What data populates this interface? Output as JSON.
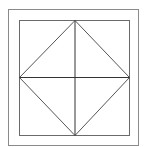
{
  "diagram": {
    "canvas": {
      "width": 146,
      "height": 147,
      "background": "#ffffff"
    },
    "outer_square": {
      "x": 8.5,
      "y": 9.5,
      "width": 130,
      "height": 136,
      "stroke": "#8a8a8a",
      "stroke_width": 1
    },
    "inner_square": {
      "x": 19.5,
      "y": 20.5,
      "width": 110,
      "height": 115,
      "stroke": "#6a6a6a",
      "stroke_width": 1
    },
    "diamond": {
      "points": "75,20.5 129.5,77.5 75,135.5 19.5,77.5",
      "stroke": "#555555",
      "stroke_width": 1
    },
    "vertical_line": {
      "x1": 75,
      "y1": 20.5,
      "x2": 75,
      "y2": 135.5,
      "stroke": "#333333"
    },
    "horizontal_line": {
      "x1": 19.5,
      "y1": 77.5,
      "x2": 129.5,
      "y2": 77.5,
      "stroke": "#333333"
    }
  }
}
